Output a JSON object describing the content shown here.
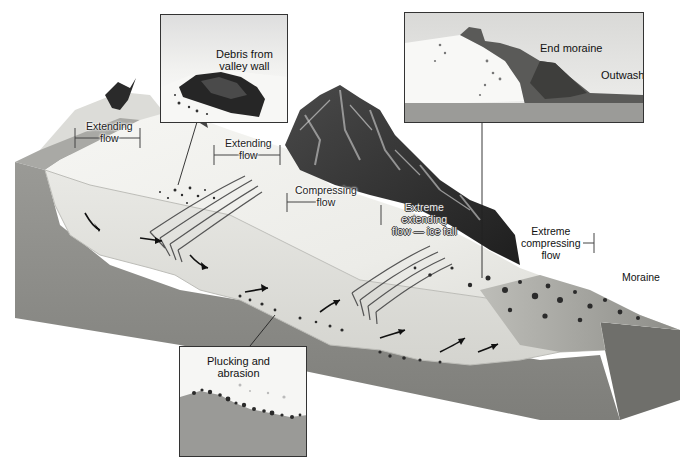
{
  "figure": {
    "colors": {
      "background": "#ffffff",
      "ice": "#eeeeea",
      "ice_shadow": "#cfcfca",
      "bedrock": "#8c8c88",
      "bedrock_dark": "#6f6f6b",
      "mountain": "#2f2f2f",
      "debris": "#333333",
      "frame": "#333333"
    }
  },
  "labels": {
    "extending_flow_1": [
      "Extending",
      "flow"
    ],
    "extending_flow_2": [
      "Extending",
      "flow"
    ],
    "compressing_flow": [
      "Compressing",
      "flow"
    ],
    "extreme_extending": [
      "Extreme",
      "extending",
      "flow — ice fall"
    ],
    "extreme_compressing": [
      "Extreme",
      "compressing",
      "flow"
    ],
    "moraine": "Moraine"
  },
  "insets": {
    "debris": {
      "title_line1": "Debris from",
      "title_line2": "valley wall"
    },
    "terminus": {
      "end_moraine": "End moraine",
      "outwash": "Outwash"
    },
    "bed": {
      "title_line1": "Plucking and",
      "title_line2": "abrasion"
    }
  }
}
